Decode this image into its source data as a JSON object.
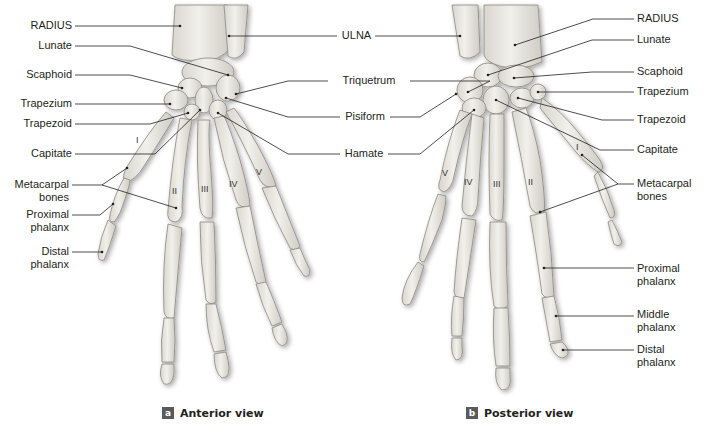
{
  "figure": {
    "panels": [
      {
        "id": "a",
        "caption_letter": "a",
        "caption": "Anterior view",
        "left_labels": {
          "radius": "RADIUS",
          "lunate": "Lunate",
          "scaphoid": "Scaphoid",
          "trapezium": "Trapezium",
          "trapezoid": "Trapezoid",
          "capitate": "Capitate",
          "metacarpal_1": "Metacarpal",
          "metacarpal_2": "bones",
          "proximal_1": "Proximal",
          "proximal_2": "phalanx",
          "distal_1": "Distal",
          "distal_2": "phalanx"
        },
        "metacarpal_numerals": [
          "I",
          "II",
          "III",
          "IV",
          "V"
        ]
      },
      {
        "id": "b",
        "caption_letter": "b",
        "caption": "Posterior view",
        "right_labels": {
          "radius": "RADIUS",
          "lunate": "Lunate",
          "scaphoid": "Scaphoid",
          "trapezium": "Trapezium",
          "trapezoid": "Trapezoid",
          "capitate": "Capitate",
          "metacarpal_1": "Metacarpal",
          "metacarpal_2": "bones",
          "proximal_1": "Proximal",
          "proximal_2": "phalanx",
          "middle_1": "Middle",
          "middle_2": "phalanx",
          "distal_1": "Distal",
          "distal_2": "phalanx"
        },
        "metacarpal_numerals": [
          "V",
          "IV",
          "III",
          "II",
          "I"
        ]
      }
    ],
    "center_labels": {
      "ulna": "ULNA",
      "triquetrum": "Triquetrum",
      "pisiform": "Pisiform",
      "hamate": "Hamate"
    },
    "colors": {
      "bone_fill": "#e9e7e1",
      "bone_stroke": "#8a8780",
      "leader_line": "#231f20",
      "badge": "#5a5a5a"
    }
  }
}
